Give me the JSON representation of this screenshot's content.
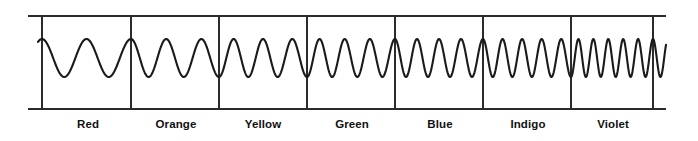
{
  "figure": {
    "background_color": "#ffffff",
    "stroke_color": "#1a1a1a",
    "axis_color": "#2b2b2b"
  },
  "frame": {
    "top_line_y": 16,
    "bottom_line_y": 109,
    "left_x": 28,
    "right_x": 666,
    "divider_xs": [
      42,
      131,
      219,
      307,
      395,
      483,
      571,
      653
    ]
  },
  "labels": [
    {
      "text": "Red",
      "x": 88
    },
    {
      "text": "Orange",
      "x": 176
    },
    {
      "text": "Yellow",
      "x": 263
    },
    {
      "text": "Green",
      "x": 352
    },
    {
      "text": "Blue",
      "x": 440
    },
    {
      "text": "Indigo",
      "x": 528
    },
    {
      "text": "Violet",
      "x": 613
    }
  ],
  "chart_data": {
    "type": "line",
    "xlabel": "",
    "ylabel": "",
    "grid": false,
    "legend_position": "none",
    "axis_ranges": {
      "x": [
        28,
        666
      ],
      "y": [
        16,
        109
      ]
    },
    "wave": {
      "description": "Continuous sinusoid whose frequency increases stepwise from Red to Violet",
      "baseline_y": 58,
      "amplitude": 19,
      "peak_y": 39,
      "trough_y": 77,
      "start_x": 38,
      "end_x": 666,
      "stroke_width": 2.1
    },
    "categories": [
      "Red",
      "Orange",
      "Yellow",
      "Green",
      "Blue",
      "Indigo",
      "Violet"
    ],
    "series": [
      {
        "name": "cycles per band",
        "values": [
          2,
          2.5,
          3,
          3.5,
          4,
          4.5,
          5.5
        ]
      },
      {
        "name": "band start x",
        "values": [
          42,
          131,
          219,
          307,
          395,
          483,
          571
        ]
      },
      {
        "name": "band end x",
        "values": [
          131,
          219,
          307,
          395,
          483,
          571,
          653
        ]
      }
    ],
    "annotations": [
      "Wavelength decreases left to right",
      "Frequency increases left to right"
    ]
  }
}
